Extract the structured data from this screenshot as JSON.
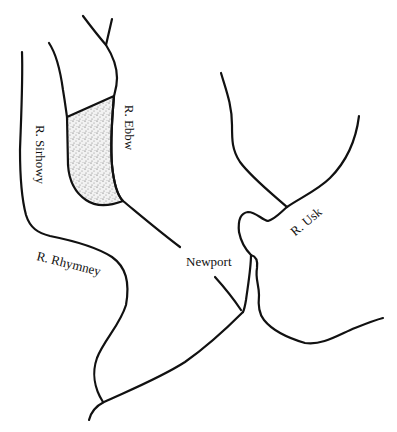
{
  "map": {
    "background": "#ffffff",
    "ink_color": "#111111",
    "labels": {
      "ebbw": "R. Ebbw",
      "sirhowy": "R. Sirhowy",
      "rhymney": "R. Rhymney",
      "newport": "Newport",
      "usk": "R. Usk"
    },
    "features": {
      "shaded_area": "stippled region between R. Sirhowy and R. Ebbw"
    }
  }
}
